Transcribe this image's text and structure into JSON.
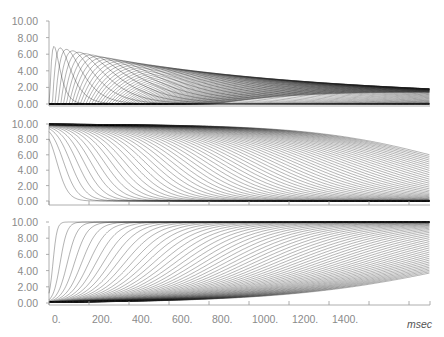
{
  "chart_data": [
    {
      "type": "line",
      "panel": "top",
      "title": "",
      "xlabel": "msec",
      "ylabel": "",
      "ylim": [
        0,
        10
      ],
      "xlim": [
        0,
        1900
      ],
      "yticks": [
        "0.00",
        "2.00",
        "4.00",
        "6.00",
        "8.00",
        "10.00"
      ],
      "description": "Family of ~60 alpha-function-like transient curves with increasing delay; peak amplitude decays from ~7.1 (at ~30 ms) toward ~0.5 by 1900 ms",
      "series_model": {
        "count": 60,
        "first_peak": {
          "x_ms": 30,
          "y": 7.1
        },
        "peak_samples": [
          {
            "x_ms": 30,
            "y": 7.1
          },
          {
            "x_ms": 60,
            "y": 6.3
          },
          {
            "x_ms": 100,
            "y": 5.6
          },
          {
            "x_ms": 200,
            "y": 4.3
          },
          {
            "x_ms": 400,
            "y": 3.2
          },
          {
            "x_ms": 800,
            "y": 2.0
          },
          {
            "x_ms": 1200,
            "y": 1.4
          },
          {
            "x_ms": 1900,
            "y": 0.6
          }
        ]
      },
      "grid": false,
      "legend": "none"
    },
    {
      "type": "line",
      "panel": "middle",
      "xlabel": "msec",
      "ylim": [
        0,
        10
      ],
      "xlim": [
        0,
        1900
      ],
      "yticks": [
        "0.00",
        "2.00",
        "4.00",
        "6.00",
        "8.00",
        "10.00"
      ],
      "description": "Family of ~60 decreasing sigmoid curves from 10 to 0 with staggered onsets; envelope stays near 10 until ~900 ms then falls to ~1.8 at 1900 ms",
      "series_model": {
        "count": 60,
        "start": 10,
        "end": 0,
        "first_midpoint_ms": 40,
        "last_curve_value_at_end": 1.8
      },
      "grid": false,
      "legend": "none"
    },
    {
      "type": "line",
      "panel": "bottom",
      "xlabel": "msec",
      "ylim": [
        0,
        10
      ],
      "xlim": [
        0,
        1900
      ],
      "yticks": [
        "0.00",
        "2.00",
        "4.00",
        "6.00",
        "8.00",
        "10.00"
      ],
      "description": "Family of ~60 increasing sigmoid curves from 0 to 10 with staggered onsets; lower envelope reaches ~8.2 at 1900 ms",
      "series_model": {
        "count": 60,
        "start": 0,
        "end": 10,
        "first_midpoint_ms": 20,
        "last_curve_value_at_end": 8.2
      },
      "grid": false,
      "legend": "none"
    }
  ],
  "x_axis": {
    "tick_labels": [
      "0.",
      "200.",
      "400.",
      "600.",
      "800.",
      "1000.",
      "1200.",
      "1400."
    ],
    "unlabeled_ticks_ms": [
      1600,
      1800
    ],
    "unit_label": "msec"
  },
  "y_axis": {
    "tick_labels": [
      "0.00",
      "2.00",
      "4.00",
      "6.00",
      "8.00",
      "10.00"
    ]
  },
  "colors": {
    "curve": "#1a1a1a",
    "axis": "#9a9a9a",
    "tick_label": "#8a8a8a",
    "background": "#ffffff"
  }
}
